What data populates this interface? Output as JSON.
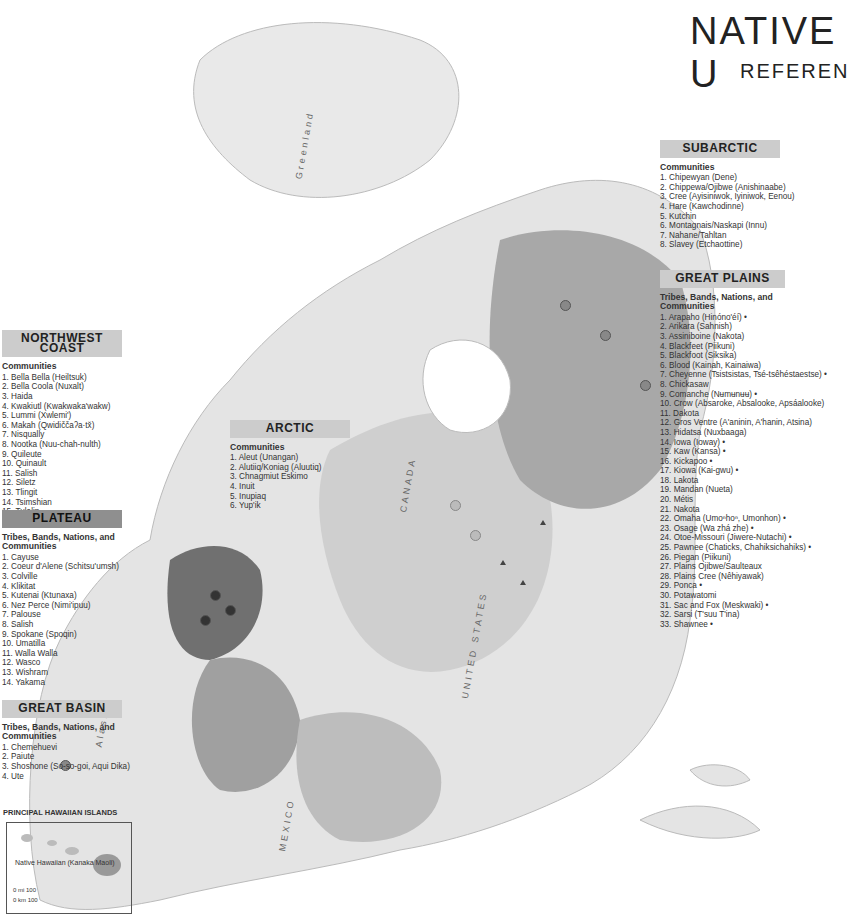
{
  "title": {
    "main": "NATIVE U",
    "sub": "REFEREN"
  },
  "regions": {
    "subarctic": {
      "header": "SUBARCTIC",
      "subheader": "Communities",
      "items": [
        "1. Chipewyan (Dene)",
        "2. Chippewa/Ojibwe (Anishinaabe)",
        "3. Cree (Ayisiniwok, Iyiniwok, Eenou)",
        "4. Hare (Kawchodinne)",
        "5. Kutchin",
        "6. Montagnais/Naskapi (Innu)",
        "7. Nahane/Tahltan",
        "8. Slavey (Etchaottine)"
      ]
    },
    "great_plains": {
      "header": "GREAT PLAINS",
      "subheader": "Tribes, Bands, Nations, and Communities",
      "items": [
        "1. Arapaho (Hinóno'éí) •",
        "2. Arikara (Sahnish)",
        "3. Assiniboine (Nakota)",
        "4. Blackfeet (Piikuni)",
        "5. Blackfoot (Siksika)",
        "6. Blood (Kainah, Kainaiwa)",
        "7. Cheyenne (Tsistsistas, Tsé-tsêhéstaestse) •",
        "8. Chickasaw",
        "9. Comanche (Nʉmʉnʉʉ) •",
        "10. Crow (Absaroke, Absalooke, Apsáalooke)",
        "11. Dakota",
        "12. Gros Ventre (A'aninin, A'hanin, Atsina)",
        "13. Hidatsa (Nuxbaaga)",
        "14. Iowa (Ioway) •",
        "15. Kaw (Kansa) •",
        "16. Kickapoo •",
        "17. Kiowa (Kai-gwu) •",
        "18. Lakota",
        "19. Mandan (Nueta)",
        "20. Métis",
        "21. Nakota",
        "22. Omaha (Umoⁿhoⁿ, Umonhon) •",
        "23. Osage (Wa zhá zhe) •",
        "24. Otoe-Missouri (Jiwere-Nutachi) •",
        "25. Pawnee (Chaticks, Chahiksichahiks) •",
        "26. Piegan (Piikuni)",
        "27. Plains Ojibwe/Saulteaux",
        "28. Plains Cree (Nêhiyawak)",
        "29. Ponca •",
        "30. Potawatomi",
        "31. Sac and Fox (Meskwaki) •",
        "32. Sarsi (T'suu T'ina)",
        "33. Shawnee •"
      ]
    },
    "arctic": {
      "header": "ARCTIC",
      "subheader": "Communities",
      "items": [
        "1. Aleut (Unangan)",
        "2. Alutiiq/Koniag (Aluutiq)",
        "3. Chnagmiut Eskimo",
        "4. Inuit",
        "5. Inupiaq",
        "6. Yup'ik"
      ]
    },
    "northwest_coast": {
      "header": "NORTHWEST COAST",
      "subheader": "Communities",
      "items": [
        "1. Bella Bella (Heiltsuk)",
        "2. Bella Coola (Nuxalt)",
        "3. Haida",
        "4. Kwakiutl (Kwakwaka'wakw)",
        "5. Lummi (Xwlemi')",
        "6. Makah (Qwidiččaʔa·tx̌)",
        "7. Nisqually",
        "8. Nootka (Nuu-chah-nulth)",
        "9. Quileute",
        "10. Quinault",
        "11. Salish",
        "12. Siletz",
        "13. Tlingit",
        "14. Tsimshian",
        "15. Tulalip"
      ]
    },
    "plateau": {
      "header": "PLATEAU",
      "subheader": "Tribes, Bands, Nations, and Communities",
      "items": [
        "1. Cayuse",
        "2. Coeur d'Alene (Schitsu'umsh)",
        "3. Colville",
        "4. Klikitat",
        "5. Kutenai (Ktunaxa)",
        "6. Nez Perce (Nimi'ipuu)",
        "7. Palouse",
        "8. Salish",
        "9. Spokane (Spoqin)",
        "10. Umatilla",
        "11. Walla Walla",
        "12. Wasco",
        "13. Wishram",
        "14. Yakama"
      ]
    },
    "great_basin": {
      "header": "GREAT BASIN",
      "subheader": "Tribes, Bands, Nations, and Communities",
      "items": [
        "1. Chemehuevi",
        "2. Paiute",
        "3. Shoshone (So-so-goi, Aqui Dika)",
        "4. Ute"
      ]
    }
  },
  "inset": {
    "title": "PRINCIPAL HAWAIIAN ISLANDS",
    "label": "Native Hawaiian (Kanaka Maoli)",
    "scale_mi": "0  mi  100",
    "scale_km": "0  km  100"
  },
  "map_labels": {
    "greenland": "Greenland",
    "greenland_sub": "(DENMARK)",
    "alaska": "Alaska",
    "alaska_sub": "(U.S.)",
    "canada": "CANADA",
    "united_states": "UNITED STATES",
    "mexico": "MEXICO",
    "bahamas": "BAHAMAS",
    "cuba": "CUBA",
    "jamaica": "JAMAICA",
    "haiti": "HAITI",
    "dom_rep": "DOM. REP.",
    "puerto_rico": "PUERTO RICO (U.S.)",
    "belize": "BELIZE"
  },
  "colors": {
    "land": "#e6e6e6",
    "region_light": "#cfcfcf",
    "region_mid": "#a8a8a8",
    "region_dark": "#6f6f6f",
    "header_bg": "#cccccc"
  }
}
